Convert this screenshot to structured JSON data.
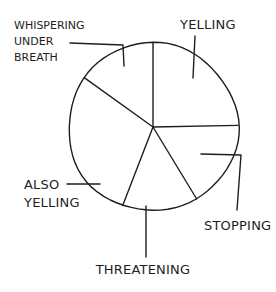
{
  "chart_data": {
    "type": "pie",
    "title": "",
    "style": "hand-drawn, black ink on white",
    "start_angle": "12 o'clock",
    "direction": "clockwise",
    "categories": [
      "Yelling",
      "Stopping",
      "Threatening",
      "Also Yelling",
      "Whispering Under Breath"
    ],
    "values": [
      24.7,
      16.7,
      14.4,
      29.2,
      15.0
    ],
    "unit": "percent (estimated from wedge angles)",
    "labels": [
      {
        "lines": [
          "YELLING"
        ],
        "placement": "top-right"
      },
      {
        "lines": [
          "STOPPING"
        ],
        "placement": "bottom-right"
      },
      {
        "lines": [
          "THREATENING"
        ],
        "placement": "bottom"
      },
      {
        "lines": [
          "ALSO",
          "YELLING"
        ],
        "placement": "left"
      },
      {
        "lines": [
          "WHISPERING",
          "UNDER",
          "BREATH"
        ],
        "placement": "top-left"
      }
    ],
    "ink_color": "#1e1e1e",
    "background_color": "#ffffff",
    "legend": "none",
    "data_labels": "category names with leader lines"
  }
}
